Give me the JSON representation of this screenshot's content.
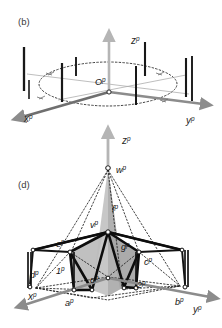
{
  "figure": {
    "background_color": "#ffffff",
    "panels": [
      {
        "tag": "(b)",
        "name": "panel-b",
        "description": "3D perspective sketch of a planar ring of vertical poles around an origin with x, y, z axes",
        "axes": [
          {
            "name": "x-axis",
            "label": "x",
            "superscript": "p",
            "color": "#8c8c8c"
          },
          {
            "name": "y-axis",
            "label": "y",
            "superscript": "p",
            "color": "#8c8c8c"
          },
          {
            "name": "z-axis",
            "label": "z",
            "superscript": "p",
            "color": "#b0b0b0"
          }
        ],
        "origin": {
          "label": "O",
          "superscript": "p"
        },
        "pole_count": 8,
        "ring_style": "dotted",
        "pole_color": "#1a1a1a"
      },
      {
        "tag": "(d)",
        "name": "panel-d",
        "description": "3D perspective sketch of a tent / pyramidal frame structure with apex w, vertex v, labelled struts and base corners",
        "axes": [
          {
            "name": "x-axis",
            "label": "x",
            "superscript": "p",
            "color": "#8c8c8c"
          },
          {
            "name": "y-axis",
            "label": "y",
            "superscript": "p",
            "color": "#8c8c8c"
          },
          {
            "name": "z-axis",
            "label": "z",
            "superscript": "p",
            "color": "#b0b0b0"
          }
        ],
        "origin": {
          "label": "o",
          "superscript": "p"
        },
        "points": [
          {
            "label": "w",
            "superscript": "p",
            "name": "apex-point-w"
          },
          {
            "label": "v",
            "superscript": "p",
            "name": "vertex-point-v"
          },
          {
            "label": "e",
            "superscript": "p",
            "name": "point-e"
          },
          {
            "label": "f",
            "superscript": "p",
            "name": "point-f"
          },
          {
            "label": "g",
            "superscript": "p",
            "name": "point-g"
          },
          {
            "label": "c",
            "superscript": "p",
            "name": "point-c"
          },
          {
            "label": "d",
            "superscript": "p",
            "name": "point-d"
          },
          {
            "label": "a",
            "superscript": "p",
            "name": "point-a"
          },
          {
            "label": "b",
            "superscript": "p",
            "name": "point-b"
          },
          {
            "label": "1",
            "superscript": "p",
            "name": "point-1"
          },
          {
            "label": "2",
            "superscript": "p",
            "name": "point-2"
          }
        ],
        "frame_color": "#111111",
        "shade_color": "#b9b9b9",
        "shade_color_dark": "#8f8f8f"
      }
    ]
  }
}
